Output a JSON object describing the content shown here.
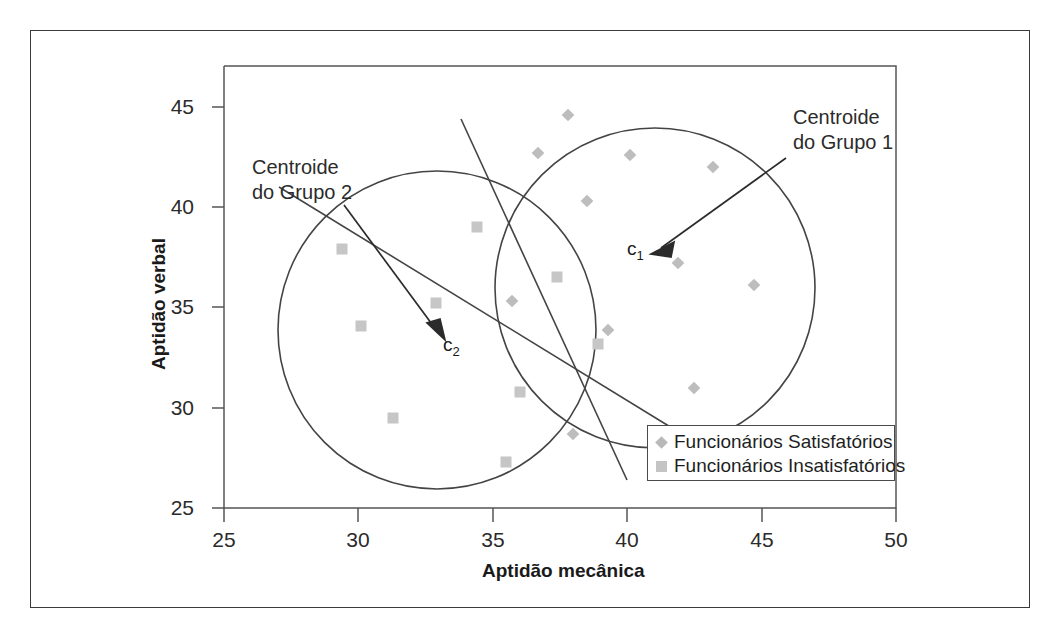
{
  "chart_data": {
    "type": "scatter",
    "title": "",
    "xlabel": "Aptidão mecânica",
    "ylabel": "Aptidão verbal",
    "xlim": [
      25,
      50
    ],
    "ylim": [
      25,
      45
    ],
    "xticks": [
      "25",
      "30",
      "35",
      "40",
      "45",
      "50"
    ],
    "yticks": [
      "25",
      "30",
      "35",
      "40",
      "45"
    ],
    "grid": false,
    "legend_position": "bottom-right",
    "series": [
      {
        "name": "Funcionários Satisfatórios",
        "marker": "diamond",
        "color": "#bdbdbd",
        "points": [
          [
            37.8,
            44.6
          ],
          [
            36.7,
            42.7
          ],
          [
            40.1,
            42.6
          ],
          [
            43.2,
            42.0
          ],
          [
            38.5,
            40.3
          ],
          [
            41.9,
            37.2
          ],
          [
            44.7,
            36.1
          ],
          [
            35.7,
            35.3
          ],
          [
            39.3,
            33.9
          ],
          [
            42.5,
            31.0
          ],
          [
            38.0,
            28.7
          ]
        ]
      },
      {
        "name": "Funcionários Insatisfatórios",
        "marker": "square",
        "color": "#c6c6c6",
        "points": [
          [
            34.4,
            39.0
          ],
          [
            29.4,
            37.9
          ],
          [
            37.4,
            36.5
          ],
          [
            32.9,
            35.2
          ],
          [
            30.1,
            34.1
          ],
          [
            38.9,
            33.2
          ],
          [
            36.0,
            30.8
          ],
          [
            31.3,
            29.5
          ],
          [
            35.5,
            27.3
          ]
        ]
      }
    ],
    "clusters": [
      {
        "name": "Grupo 1",
        "centroid_label": "c1",
        "centroid": [
          40.9,
          32.0
        ],
        "circle_center": [
          41.0,
          35.9
        ],
        "circle_radius_x": 5.9
      },
      {
        "name": "Grupo 2",
        "centroid_label": "c2",
        "centroid": [
          33.1,
          33.6
        ],
        "circle_center": [
          32.9,
          33.9
        ],
        "circle_radius_x": 5.9
      }
    ],
    "annotations": [
      {
        "id": "centroid1",
        "line1": "Centroide",
        "line2": "do Grupo 1"
      },
      {
        "id": "centroid2",
        "line1": "Centroide",
        "line2": "do Grupo 2"
      }
    ]
  },
  "axis": {
    "x_title": "Aptidão mecânica",
    "y_title": "Aptidão verbal",
    "x_ticks": [
      "25",
      "30",
      "35",
      "40",
      "45",
      "50"
    ],
    "y_ticks": [
      "45",
      "40",
      "35",
      "30",
      "25"
    ]
  },
  "legend": {
    "items": [
      {
        "label": "Funcionários Satisfatórios",
        "marker": "diamond-marker"
      },
      {
        "label": "Funcionários Insatisfatórios",
        "marker": "square-marker"
      }
    ]
  },
  "annotations": {
    "group1": {
      "line1": "Centroide",
      "line2": "do Grupo 1",
      "centroid_symbol": "c",
      "centroid_sub": "1"
    },
    "group2": {
      "line1": "Centroide",
      "line2": "do Grupo 2",
      "centroid_symbol": "c",
      "centroid_sub": "2"
    }
  },
  "colors": {
    "frame": "#3a3a3a",
    "diamond": "#bdbdbd",
    "square": "#c6c6c6",
    "text": "#1a1a1a",
    "circle_stroke": "#444444"
  }
}
